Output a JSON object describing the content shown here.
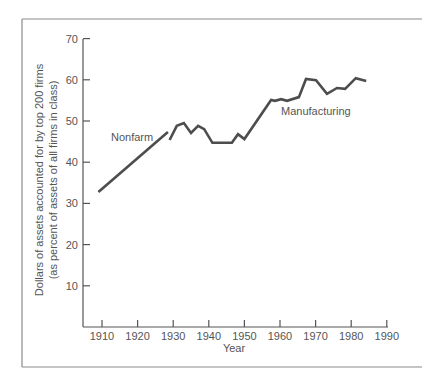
{
  "chart_data": {
    "type": "line",
    "title": "",
    "xlabel": "Year",
    "ylabel": "Dollars of assets accounted for by top 200 firms",
    "ylabel_line2": "(as percent of assets of all firms in class)",
    "xlim": [
      1905,
      1990
    ],
    "ylim": [
      0,
      70
    ],
    "x_ticks": [
      1910,
      1920,
      1930,
      1940,
      1950,
      1960,
      1970,
      1980,
      1990
    ],
    "y_ticks": [
      10,
      20,
      30,
      40,
      50,
      60,
      70
    ],
    "grid": false,
    "legend": "inline labels",
    "series": [
      {
        "name": "Nonfarm",
        "x": [
          1909,
          1928.5
        ],
        "values": [
          32.8,
          47.3
        ]
      },
      {
        "name": "Manufacturing",
        "x": [
          1929,
          1931,
          1933,
          1935,
          1937,
          1938.7,
          1941,
          1946.5,
          1948.2,
          1950,
          1957.5,
          1958.6,
          1960.3,
          1962,
          1965.3,
          1967.3,
          1970.1,
          1973.2,
          1976,
          1978.3,
          1981.3,
          1984.2
        ],
        "values": [
          45.4,
          48.8,
          49.5,
          47.1,
          48.8,
          48.0,
          44.7,
          44.7,
          46.8,
          45.6,
          55.1,
          54.9,
          55.3,
          54.9,
          55.8,
          60.2,
          59.9,
          56.6,
          58.0,
          57.8,
          60.4,
          59.7
        ]
      }
    ]
  },
  "labels": {
    "nonfarm": "Nonfarm",
    "manufacturing": "Manufacturing",
    "xaxis": "Year",
    "yaxis_line1": "Dollars of assets accounted for by top 200 firms",
    "yaxis_line2": "(as percent of assets of all firms in class)",
    "yticks": [
      "10",
      "20",
      "30",
      "40",
      "50",
      "60",
      "70"
    ],
    "xticks": [
      "1910",
      "1920",
      "1930",
      "1940",
      "1950",
      "1960",
      "1970",
      "1980",
      "1990"
    ]
  }
}
